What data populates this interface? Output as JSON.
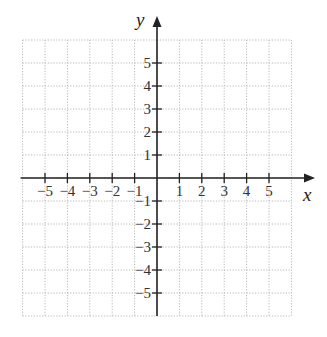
{
  "chart_data": {
    "type": "scatter",
    "title": "",
    "xlabel": "x",
    "ylabel": "y",
    "xlim": [
      -6,
      6
    ],
    "ylim": [
      -6,
      6
    ],
    "grid": true,
    "grid_style": "dotted",
    "x_ticks": [
      -5,
      -4,
      -3,
      -2,
      -1,
      1,
      2,
      3,
      4,
      5
    ],
    "y_ticks": [
      -5,
      -4,
      -3,
      -2,
      -1,
      1,
      2,
      3,
      4,
      5
    ],
    "x_tick_labels": [
      "−5",
      "−4",
      "−3",
      "−2",
      "−1",
      "1",
      "2",
      "3",
      "4",
      "5"
    ],
    "y_tick_labels": [
      "−5",
      "−4",
      "−3",
      "−2",
      "−1",
      "1",
      "2",
      "3",
      "4",
      "5"
    ],
    "series": [],
    "legend": null
  },
  "colors": {
    "axis": "#222222",
    "grid": "#b8b8b8",
    "background": "#ffffff"
  }
}
